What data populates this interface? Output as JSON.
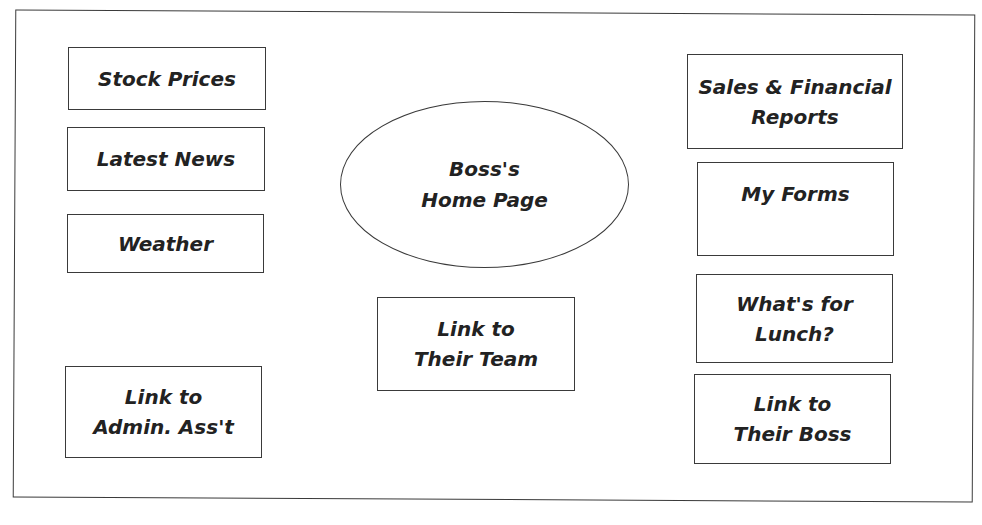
{
  "diagram": {
    "center": {
      "lines": [
        "Boss's",
        "Home Page"
      ]
    },
    "left_column": [
      {
        "lines": [
          "Stock Prices"
        ]
      },
      {
        "lines": [
          "Latest News"
        ]
      },
      {
        "lines": [
          "Weather"
        ]
      },
      {
        "lines": [
          "Link to",
          "Admin. Ass't"
        ]
      }
    ],
    "middle_column": [
      {
        "lines": [
          "Link to",
          "Their Team"
        ]
      }
    ],
    "right_column": [
      {
        "lines": [
          "Sales & Financial",
          "Reports"
        ]
      },
      {
        "lines": [
          "My Forms"
        ]
      },
      {
        "lines": [
          "What's for",
          "Lunch?"
        ]
      },
      {
        "lines": [
          "Link to",
          "Their Boss"
        ]
      }
    ],
    "colors": {
      "stroke": "#3a3a3a",
      "text": "#222222",
      "background": "#ffffff"
    }
  }
}
